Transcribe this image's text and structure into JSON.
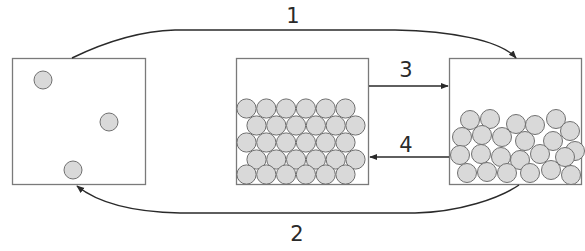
{
  "diagram": {
    "title": "",
    "colors": {
      "box_stroke": "#7a7a7a",
      "particle_fill": "#d9d9d9",
      "particle_stroke": "#707070",
      "arrow": "#2a2a2a",
      "label": "#2a2a2a"
    },
    "boxes": [
      {
        "id": "gas",
        "x": 12,
        "y": 58,
        "w": 133,
        "h": 126,
        "particles": [
          [
            43,
            80,
            9
          ],
          [
            109,
            122,
            9
          ],
          [
            73,
            170,
            9
          ]
        ]
      },
      {
        "id": "solid",
        "x": 236,
        "y": 58,
        "w": 132,
        "h": 126,
        "layout": "hexagonal",
        "rows": 5
      },
      {
        "id": "liquid",
        "x": 449,
        "y": 58,
        "w": 132,
        "h": 126,
        "layout": "random"
      }
    ],
    "arrows": [
      {
        "id": "1",
        "label": "1",
        "from": "gas",
        "to": "liquid",
        "path": "top-curve",
        "label_x": 293,
        "label_y": 16
      },
      {
        "id": "2",
        "label": "2",
        "from": "liquid",
        "to": "gas",
        "path": "bottom-curve",
        "label_x": 297,
        "label_y": 234
      },
      {
        "id": "3",
        "label": "3",
        "from": "solid",
        "to": "liquid",
        "path": "straight",
        "label_x": 406,
        "label_y": 70
      },
      {
        "id": "4",
        "label": "4",
        "from": "liquid",
        "to": "solid",
        "path": "straight",
        "label_x": 406,
        "label_y": 145
      }
    ]
  }
}
